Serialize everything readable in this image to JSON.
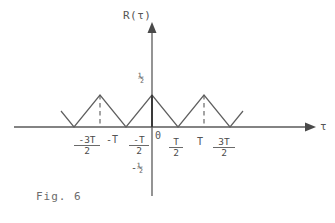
{
  "figure": {
    "caption": "Fig. 6",
    "background_color": "#ffffff",
    "ink_color": "#555555"
  },
  "axes": {
    "y_axis_label": "R(τ)",
    "x_axis_label": "τ",
    "origin_label": "0",
    "y_positive_label": "½",
    "y_negative_label": "-½"
  },
  "ticks": {
    "left": [
      {
        "name": "minus-three-half-T",
        "numerator": "-3T",
        "denominator": "2",
        "value": -1.5
      },
      {
        "name": "minus-T",
        "text": "-T",
        "value": -1.0
      },
      {
        "name": "minus-half-T",
        "numerator": "-T",
        "denominator": "2",
        "value": -0.5
      }
    ],
    "right": [
      {
        "name": "half-T",
        "numerator": "T",
        "denominator": "2",
        "value": 0.5
      },
      {
        "name": "T",
        "text": "T",
        "value": 1.0
      },
      {
        "name": "three-half-T",
        "numerator": "3T",
        "denominator": "2",
        "value": 1.5
      }
    ]
  },
  "chart_data": {
    "type": "line",
    "title": "Fig. 6",
    "xlabel": "τ",
    "ylabel": "R(τ)",
    "xlim": [
      -1.75,
      1.75
    ],
    "ylim": [
      -0.5,
      0.6
    ],
    "grid": false,
    "legend": null,
    "series": [
      {
        "name": "R(tau)",
        "x": [
          -1.75,
          -1.5,
          -1.0,
          -0.5,
          0.0,
          0.5,
          1.0,
          1.5,
          1.75
        ],
        "y": [
          0.25,
          0.0,
          0.5,
          0.0,
          0.5,
          0.0,
          0.5,
          0.0,
          0.25
        ]
      }
    ],
    "annotations": [
      {
        "name": "dashed-guide-minus-T",
        "x": -1.0,
        "from_y": 0.0,
        "to_y": 0.5,
        "style": "dashed"
      },
      {
        "name": "dashed-guide-plus-T",
        "x": 1.0,
        "from_y": 0.0,
        "to_y": 0.5,
        "style": "dashed"
      },
      {
        "name": "solid-guide-zero",
        "x": 0.0,
        "from_y": 0.0,
        "to_y": 0.5,
        "style": "solid"
      }
    ],
    "ytick_labels": [
      "½",
      "-½"
    ],
    "ytick_values": [
      0.5,
      -0.5
    ],
    "xtick_labels": [
      "-3T/2",
      "-T",
      "-T/2",
      "0",
      "T/2",
      "T",
      "3T/2"
    ],
    "xtick_values": [
      -1.5,
      -1.0,
      -0.5,
      0.0,
      0.5,
      1.0,
      1.5
    ]
  }
}
